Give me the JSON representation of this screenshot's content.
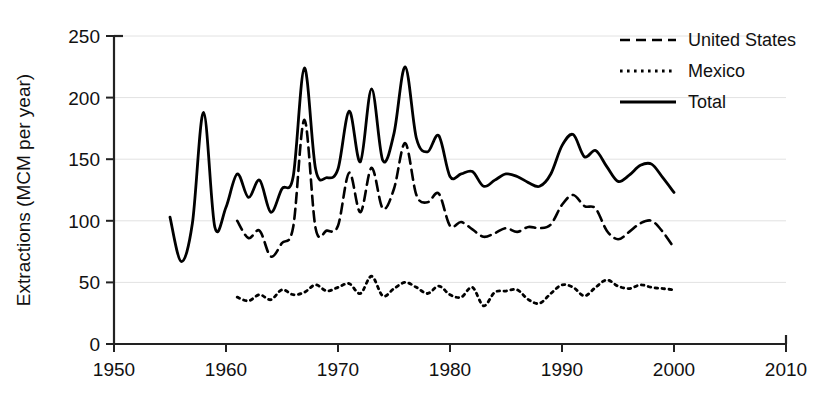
{
  "chart_data": {
    "type": "line",
    "title": "",
    "xlabel": "",
    "ylabel": "Extractions (MCM per year)",
    "xlim": [
      1950,
      2010
    ],
    "ylim": [
      0,
      250
    ],
    "xticks": [
      1950,
      1960,
      1970,
      1980,
      1990,
      2000,
      2010
    ],
    "yticks": [
      0,
      50,
      100,
      150,
      200,
      250
    ],
    "grid": "horizontal",
    "legend_position": "top-right",
    "series": [
      {
        "name": "United States",
        "style": "dashed",
        "color": "#000000",
        "x": [
          1961,
          1962,
          1963,
          1964,
          1965,
          1966,
          1967,
          1968,
          1969,
          1970,
          1971,
          1972,
          1973,
          1974,
          1975,
          1976,
          1977,
          1978,
          1979,
          1980,
          1981,
          1982,
          1983,
          1984,
          1985,
          1986,
          1987,
          1988,
          1989,
          1990,
          1991,
          1992,
          1993,
          1994,
          1995,
          1996,
          1997,
          1998,
          1999,
          2000
        ],
        "values": [
          100,
          86,
          92,
          71,
          82,
          95,
          182,
          94,
          92,
          96,
          139,
          107,
          143,
          110,
          126,
          163,
          121,
          115,
          122,
          96,
          99,
          93,
          87,
          90,
          94,
          91,
          95,
          94,
          97,
          113,
          121,
          112,
          110,
          92,
          85,
          91,
          98,
          100,
          91,
          78
        ]
      },
      {
        "name": "Mexico",
        "style": "dotted",
        "color": "#000000",
        "x": [
          1961,
          1962,
          1963,
          1964,
          1965,
          1966,
          1967,
          1968,
          1969,
          1970,
          1971,
          1972,
          1973,
          1974,
          1975,
          1976,
          1977,
          1978,
          1979,
          1980,
          1981,
          1982,
          1983,
          1984,
          1985,
          1986,
          1987,
          1988,
          1989,
          1990,
          1991,
          1992,
          1993,
          1994,
          1995,
          1996,
          1997,
          1998,
          1999,
          2000
        ],
        "values": [
          38,
          35,
          40,
          36,
          44,
          40,
          42,
          48,
          43,
          46,
          49,
          41,
          55,
          39,
          45,
          50,
          46,
          41,
          47,
          40,
          38,
          46,
          31,
          42,
          43,
          44,
          36,
          33,
          41,
          48,
          46,
          39,
          46,
          52,
          47,
          45,
          48,
          46,
          45,
          44
        ]
      },
      {
        "name": "Total",
        "style": "solid",
        "color": "#000000",
        "x": [
          1955,
          1956,
          1957,
          1958,
          1959,
          1960,
          1961,
          1962,
          1963,
          1964,
          1965,
          1966,
          1967,
          1968,
          1969,
          1970,
          1971,
          1972,
          1973,
          1974,
          1975,
          1976,
          1977,
          1978,
          1979,
          1980,
          1981,
          1982,
          1983,
          1984,
          1985,
          1986,
          1987,
          1988,
          1989,
          1990,
          1991,
          1992,
          1993,
          1994,
          1995,
          1996,
          1997,
          1998,
          1999,
          2000
        ],
        "values": [
          103,
          67,
          98,
          188,
          95,
          111,
          138,
          119,
          133,
          107,
          126,
          136,
          224,
          142,
          135,
          142,
          189,
          148,
          207,
          149,
          171,
          225,
          167,
          156,
          169,
          136,
          138,
          140,
          128,
          133,
          138,
          136,
          131,
          128,
          138,
          161,
          170,
          152,
          157,
          144,
          132,
          137,
          145,
          146,
          135,
          123
        ]
      }
    ]
  },
  "axes": {
    "y_label": "Extractions (MCM per year)",
    "y_tick_labels": [
      "0",
      "50",
      "100",
      "150",
      "200",
      "250"
    ],
    "x_tick_labels": [
      "1950",
      "1960",
      "1970",
      "1980",
      "1990",
      "2000",
      "2010"
    ]
  },
  "legend": {
    "entries": [
      {
        "label": "United States",
        "style": "dashed"
      },
      {
        "label": "Mexico",
        "style": "dotted"
      },
      {
        "label": "Total",
        "style": "solid"
      }
    ]
  }
}
